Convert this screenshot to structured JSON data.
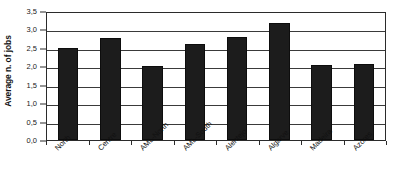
{
  "chart_data": {
    "type": "bar",
    "title": "",
    "xlabel": "",
    "ylabel": "Average n. of jobs",
    "categories": [
      "North",
      "Centre",
      "AML-North",
      "AML-South",
      "Alentejo",
      "Algarve",
      "Madeira",
      "Azores"
    ],
    "values": [
      2.5,
      2.76,
      2.0,
      2.6,
      2.79,
      3.18,
      2.03,
      2.06
    ],
    "ylim": [
      0.0,
      3.5
    ],
    "ytick_step": 0.5,
    "ytick_labels": [
      "3,5",
      "3,0",
      "2,5",
      "2,0",
      "1,5",
      "1,0",
      "0,5",
      "0,0"
    ],
    "ytick_values": [
      3.5,
      3.0,
      2.5,
      2.0,
      1.5,
      1.0,
      0.5,
      0.0
    ],
    "grid": true,
    "grid_axis": "y",
    "legend": false,
    "legend_position": "none",
    "bar_color": "#1c1c1c",
    "plot_background": "#ffffff",
    "axis_color": "#2b2b2b",
    "gridline_color": "#3a3a3a",
    "xlabel_rotation": -45
  }
}
